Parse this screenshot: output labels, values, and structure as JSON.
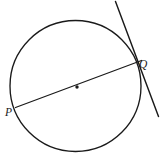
{
  "figure": {
    "background_color": "#ffffff",
    "stroke_color": "#1a1a1a",
    "width": 160,
    "height": 157,
    "circle": {
      "name": "circle-outline",
      "center_x": 75.5,
      "center_y": 86,
      "radius": 65.5,
      "stroke_width": 1.35
    },
    "center_mark": {
      "name": "center-dot",
      "x": 77,
      "y": 87,
      "radius": 1.7
    },
    "secant": {
      "name": "diameter-pq",
      "x1": 15.5,
      "y1": 107.5,
      "x2": 141.5,
      "y2": 60.5,
      "stroke_width": 1.25
    },
    "tangent": {
      "name": "tangent-at-q",
      "x1": 115.5,
      "y1": 1.5,
      "x2": 158.5,
      "y2": 116.5,
      "stroke_width": 1.45
    },
    "labels": {
      "p": "P",
      "q": "Q"
    }
  },
  "chart_data": {
    "type": "diagram",
    "elements": [
      {
        "kind": "circle",
        "label": "",
        "center": [
          75.5,
          86
        ],
        "radius": 65.5
      },
      {
        "kind": "point",
        "label": "center",
        "position": [
          77,
          87
        ]
      },
      {
        "kind": "point",
        "label": "P",
        "position": [
          17,
          107
        ]
      },
      {
        "kind": "point",
        "label": "Q",
        "position": [
          136.5,
          62.5
        ]
      },
      {
        "kind": "segment",
        "label": "PQ",
        "from": [
          15.5,
          107.5
        ],
        "to": [
          141.5,
          60.5
        ]
      },
      {
        "kind": "line",
        "label": "tangent at Q",
        "from": [
          115.5,
          1.5
        ],
        "to": [
          158.5,
          116.5
        ]
      }
    ],
    "annotations": [
      "P",
      "Q"
    ]
  }
}
